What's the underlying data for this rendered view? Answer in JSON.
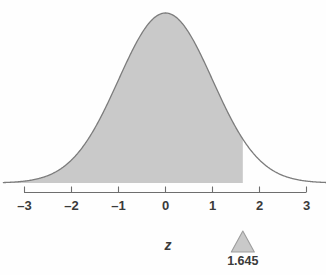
{
  "chart_data": {
    "type": "area",
    "title": "",
    "subtitle": "",
    "xlabel": "z",
    "ylabel": "",
    "xlim": [
      -3.45,
      3.45
    ],
    "ylim": [
      0,
      0.42
    ],
    "grid": false,
    "legend_position": "none",
    "curve": {
      "name": "standard normal density",
      "distribution": "normal",
      "mean": 0,
      "sd": 1,
      "peak_x": 0,
      "peak_y": 0.3989,
      "line_color": "#7c7c7c",
      "line_width": 1.2
    },
    "shaded_region": {
      "label": "area to the left of 1.645",
      "from": -3.45,
      "to": 1.645,
      "fill_color": "#c9c9c9",
      "area": 0.95
    },
    "xticks": [
      -3,
      -2,
      -1,
      0,
      1,
      2,
      3
    ],
    "xtick_labels": [
      "–3",
      "–2",
      "–1",
      "0",
      "1",
      "2",
      "3"
    ],
    "yticks": [],
    "ytick_labels": [],
    "annotations": [
      {
        "type": "triangle-marker",
        "x": 1.645,
        "label": "1.645",
        "fill_color": "#c9c9c9",
        "stroke_color": "#9d9d9d"
      }
    ]
  },
  "axis": {
    "title": "z",
    "labels": [
      "–3",
      "–2",
      "–1",
      "0",
      "1",
      "2",
      "3"
    ],
    "line_color": "#6e6e6e"
  },
  "marker": {
    "value_label": "1.645"
  },
  "colors": {
    "background": "#fefefe",
    "fill": "#c9c9c9",
    "curve": "#7c7c7c",
    "axis": "#6e6e6e",
    "text": "#3a3a3a"
  }
}
